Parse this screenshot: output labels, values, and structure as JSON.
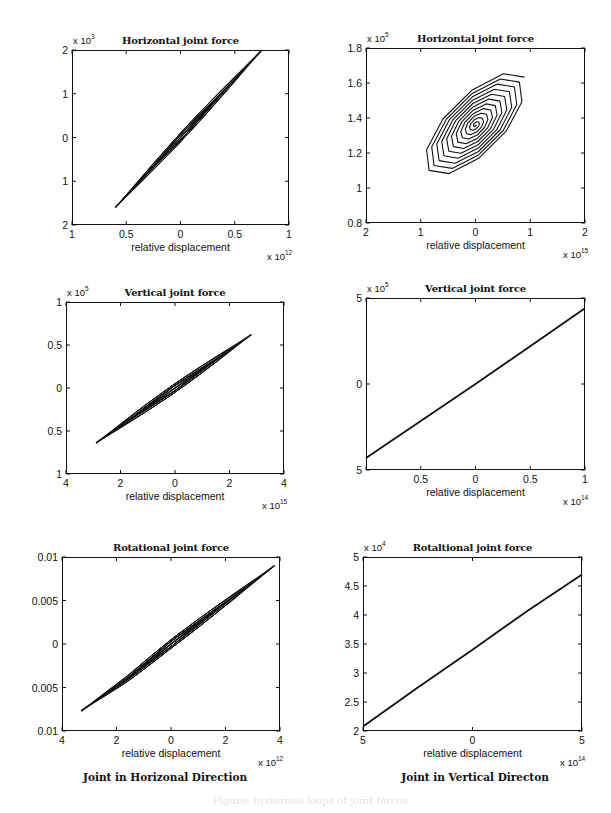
{
  "figure": {
    "caption_faint": "Figure: hysteresis loops of joint forces",
    "column_captions": [
      "Joint in Horizonal Direction",
      "Joint in Vertical Directon"
    ]
  },
  "chart_data": [
    {
      "id": "h-horizontal",
      "type": "line",
      "title": "Horizontal joint force",
      "xlabel": "relative displacement",
      "x_multiplier": "x 10^12",
      "x_mult_base": "x 10",
      "x_mult_exp": "12",
      "y_multiplier": "x 10^3",
      "y_mult_base": "x 10",
      "y_mult_exp": "3",
      "xlim": [
        -1,
        1
      ],
      "ylim": [
        -2,
        2
      ],
      "xticks": [
        -1,
        -0.5,
        0,
        0.5,
        1
      ],
      "xtick_labels": [
        "1",
        "0.5",
        "0",
        "0.5",
        "1"
      ],
      "yticks": [
        2,
        1,
        0,
        -1,
        -2
      ],
      "ytick_labels": [
        "2",
        "1",
        "0",
        "1",
        "2"
      ],
      "grid": false,
      "description": "Thin elongated hysteresis loops along a diagonal line from (-0.6,-1.6) to (0.75,2)",
      "series": [
        {
          "name": "loop",
          "x": [
            -0.6,
            -0.3,
            0,
            0.3,
            0.75
          ],
          "y": [
            -1.6,
            -0.8,
            0,
            0.8,
            2.0
          ]
        }
      ]
    },
    {
      "id": "v-horizontal",
      "type": "line",
      "title": "Horizontal joint force",
      "xlabel": "relative displacement",
      "x_multiplier": "x 10^15",
      "x_mult_base": "x 10",
      "x_mult_exp": "15",
      "y_multiplier": "x 10^5",
      "y_mult_base": "x 10",
      "y_mult_exp": "5",
      "xlim": [
        -2,
        2
      ],
      "ylim": [
        0.8,
        1.8
      ],
      "xticks": [
        -2,
        -1,
        0,
        1,
        2
      ],
      "xtick_labels": [
        "2",
        "1",
        "0",
        "1",
        "2"
      ],
      "yticks": [
        1.8,
        1.6,
        1.4,
        1.2,
        1,
        0.8
      ],
      "ytick_labels": [
        "1.8",
        "1.6",
        "1.4",
        "1.2",
        "1",
        "0.8"
      ],
      "grid": false,
      "description": "Spiral of nested polygonal loops converging to center (0, 1.36); outer loop spans x -1.0..1.25, y 0.99..1.78",
      "series": [
        {
          "name": "spiral",
          "center": [
            0,
            1.36
          ],
          "outer_x_range": [
            -1.0,
            1.25
          ],
          "outer_y_range": [
            0.99,
            1.78
          ]
        }
      ]
    },
    {
      "id": "h-vertical",
      "type": "line",
      "title": "Vertical joint force",
      "xlabel": "relative displacement",
      "x_multiplier": "x 10^15",
      "x_mult_base": "x 10",
      "x_mult_exp": "15",
      "y_multiplier": "x 10^5",
      "y_mult_base": "x 10",
      "y_mult_exp": "5",
      "xlim": [
        -4,
        4
      ],
      "ylim": [
        -1,
        1
      ],
      "xticks": [
        -4,
        -2,
        0,
        2,
        4
      ],
      "xtick_labels": [
        "4",
        "2",
        "0",
        "2",
        "4"
      ],
      "yticks": [
        1,
        0.5,
        0,
        -0.5,
        -1
      ],
      "ytick_labels": [
        "1",
        "0.5",
        "0",
        "0.5",
        "1"
      ],
      "grid": false,
      "description": "Narrow hysteresis loops from (-2.9,-0.64) to (2.8,0.62)",
      "series": [
        {
          "name": "loop",
          "x": [
            -2.9,
            -1.5,
            0,
            1.5,
            2.8
          ],
          "y": [
            -0.64,
            -0.33,
            0,
            0.33,
            0.62
          ]
        }
      ]
    },
    {
      "id": "v-vertical",
      "type": "line",
      "title": "Vertical joint force",
      "xlabel": "relative displacement",
      "x_multiplier": "x 10^14",
      "x_mult_base": "x 10",
      "x_mult_exp": "14",
      "y_multiplier": "x 10^5",
      "y_mult_base": "x 10",
      "y_mult_exp": "5",
      "xlim": [
        -1,
        1
      ],
      "ylim": [
        -5,
        5
      ],
      "xticks": [
        -1,
        -0.5,
        0,
        0.5,
        1
      ],
      "xtick_labels": [
        "",
        "0.5",
        "0",
        "0.5",
        "1"
      ],
      "yticks": [
        5,
        0,
        -5
      ],
      "ytick_labels": [
        "5",
        "0",
        "5"
      ],
      "grid": false,
      "description": "Nearly straight line from (-1,-4.3) to (1,4.4)",
      "series": [
        {
          "name": "line",
          "x": [
            -1,
            0,
            1
          ],
          "y": [
            -4.3,
            0,
            4.4
          ]
        }
      ]
    },
    {
      "id": "h-rotational",
      "type": "line",
      "title": "Rotational joint force",
      "xlabel": "relative displacement",
      "x_multiplier": "x 10^12",
      "x_mult_base": "x 10",
      "x_mult_exp": "12",
      "y_multiplier": "",
      "y_mult_base": "",
      "y_mult_exp": "",
      "xlim": [
        -4,
        4
      ],
      "ylim": [
        -0.01,
        0.01
      ],
      "xticks": [
        -4,
        -2,
        0,
        2,
        4
      ],
      "xtick_labels": [
        "4",
        "2",
        "0",
        "2",
        "4"
      ],
      "yticks": [
        0.01,
        0.005,
        0,
        -0.005,
        -0.01
      ],
      "ytick_labels": [
        "0.01",
        "0.005",
        "0",
        "0.005",
        "0.01"
      ],
      "grid": false,
      "description": "Thin loops along a line from (-3.3,-0.0077) to (3.8,0.009)",
      "series": [
        {
          "name": "loop",
          "x": [
            -3.3,
            -1.6,
            0,
            1.6,
            3.8
          ],
          "y": [
            -0.0077,
            -0.004,
            0,
            0.0038,
            0.009
          ]
        }
      ]
    },
    {
      "id": "v-rotational",
      "type": "line",
      "title": "Rotaltional joint force",
      "xlabel": "relative displacement",
      "x_multiplier": "x 10^14",
      "x_mult_base": "x 10",
      "x_mult_exp": "14",
      "y_multiplier": "x 10^4",
      "y_mult_base": "x 10",
      "y_mult_exp": "4",
      "xlim": [
        -5,
        5
      ],
      "ylim": [
        2,
        5
      ],
      "xticks": [
        -5,
        0,
        5
      ],
      "xtick_labels": [
        "5",
        "0",
        "5"
      ],
      "yticks": [
        5,
        4.5,
        4,
        3.5,
        3,
        2.5,
        2
      ],
      "ytick_labels": [
        "5",
        "4.5",
        "4",
        "3.5",
        "3",
        "2.5",
        "2"
      ],
      "grid": false,
      "description": "Slightly curved line from (-5,2.08) to (5,4.7)",
      "series": [
        {
          "name": "line",
          "x": [
            -5,
            -2.5,
            0,
            2.5,
            5
          ],
          "y": [
            2.08,
            2.75,
            3.4,
            4.07,
            4.7
          ]
        }
      ]
    }
  ]
}
